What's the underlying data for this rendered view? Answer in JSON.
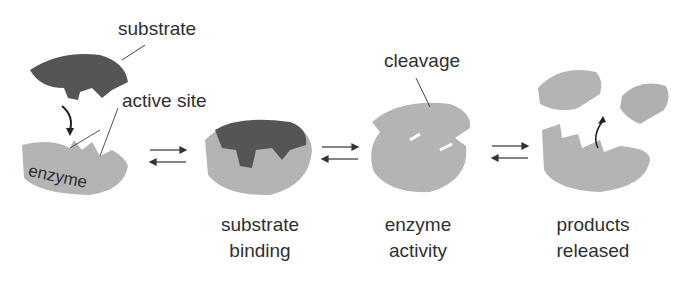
{
  "diagram": {
    "type": "enzyme-substrate reaction mechanism",
    "colors": {
      "enzyme": "#b4b4b4",
      "enzyme_shade": "#9a9a9a",
      "substrate": "#555555",
      "text": "#2f2f2f",
      "arrow": "#333333"
    },
    "labels": {
      "substrate": "substrate",
      "active_site": "active site",
      "enzyme": "enzyme",
      "cleavage": "cleavage"
    },
    "stages": [
      {
        "id": "free",
        "caption_line1": "",
        "caption_line2": ""
      },
      {
        "id": "binding",
        "caption_line1": "substrate",
        "caption_line2": "binding"
      },
      {
        "id": "activity",
        "caption_line1": "enzyme",
        "caption_line2": "activity"
      },
      {
        "id": "release",
        "caption_line1": "products",
        "caption_line2": "released"
      }
    ],
    "equilibrium_arrows": [
      "⇄",
      "⇄",
      "⇄"
    ]
  }
}
